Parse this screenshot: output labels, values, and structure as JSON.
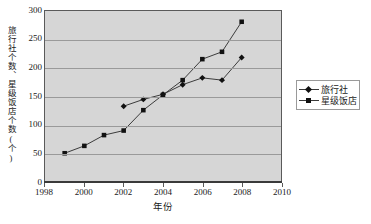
{
  "chart_data": {
    "type": "line",
    "title": "",
    "xlabel": "年份",
    "ylabel": "旅行社个数、星级饭店个数(个)",
    "xlim": [
      1998,
      2010
    ],
    "ylim": [
      0,
      300
    ],
    "xticks": [
      1998,
      2000,
      2002,
      2004,
      2006,
      2008,
      2010
    ],
    "yticks": [
      0,
      50,
      100,
      150,
      200,
      250,
      300
    ],
    "xtick_labels": [
      "1998",
      "2000",
      "2002",
      "2004",
      "2006",
      "2008",
      "2010"
    ],
    "ytick_labels": [
      "0",
      "50",
      "100",
      "150",
      "200",
      "250",
      "300"
    ],
    "grid": true,
    "legend_position": "right",
    "x": [
      1999,
      2000,
      2001,
      2002,
      2003,
      2004,
      2005,
      2006,
      2007,
      2008
    ],
    "series": [
      {
        "name": "旅行社",
        "marker": "diamond",
        "x": [
          2002,
          2003,
          2004,
          2005,
          2006,
          2007,
          2008
        ],
        "values": [
          132,
          144,
          153,
          170,
          182,
          178,
          218
        ]
      },
      {
        "name": "星级饭店",
        "marker": "square",
        "x": [
          1999,
          2000,
          2001,
          2002,
          2003,
          2004,
          2005,
          2006,
          2007,
          2008
        ],
        "values": [
          49,
          62,
          81,
          89,
          125,
          152,
          178,
          215,
          228,
          281
        ]
      }
    ]
  },
  "legend": {
    "entries": [
      {
        "label": "旅行社",
        "marker": "diamond"
      },
      {
        "label": "星级饭店",
        "marker": "square"
      }
    ]
  },
  "axes": {
    "y_title": "旅行社个数、星级饭店个数(个)",
    "x_title": "年份"
  },
  "caption": {
    "text": ""
  },
  "colors": {
    "plot_background": "#d6d6d6",
    "gridline": "#9a9a9a",
    "series_line": "#3a3a3a",
    "marker": "#111111",
    "axis": "#3a3a3a",
    "text": "#1a1a1a",
    "page_background": "#ffffff"
  }
}
